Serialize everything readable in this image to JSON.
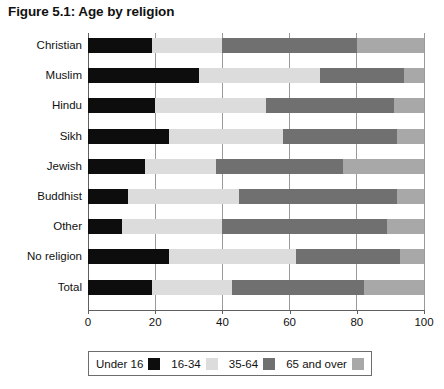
{
  "title": "Figure 5.1: Age by religion",
  "legend": {
    "entries": [
      {
        "label": "Under 16",
        "color": "#0d0d0d"
      },
      {
        "label": "16-34",
        "color": "#dcdcdc"
      },
      {
        "label": "35-64",
        "color": "#707070"
      },
      {
        "label": "65 and over",
        "color": "#a8a8a8"
      }
    ]
  },
  "axis": {
    "ticks": [
      {
        "label": "0",
        "value": 0
      },
      {
        "label": "20",
        "value": 20
      },
      {
        "label": "40",
        "value": 40
      },
      {
        "label": "60",
        "value": 60
      },
      {
        "label": "80",
        "value": 80
      },
      {
        "label": "100",
        "value": 100
      }
    ]
  },
  "chart_data": {
    "type": "bar",
    "orientation": "horizontal",
    "stacked": true,
    "title": "Figure 5.1: Age by religion",
    "xlabel": "",
    "ylabel": "",
    "xlim": [
      0,
      100
    ],
    "grid": true,
    "legend_position": "bottom",
    "categories": [
      "Christian",
      "Muslim",
      "Hindu",
      "Sikh",
      "Jewish",
      "Buddhist",
      "Other",
      "No religion",
      "Total"
    ],
    "series": [
      {
        "name": "Under 16",
        "color": "#0d0d0d",
        "values": [
          19,
          33,
          20,
          24,
          17,
          12,
          10,
          24,
          19
        ]
      },
      {
        "name": "16-34",
        "color": "#dcdcdc",
        "values": [
          21,
          36,
          33,
          34,
          21,
          33,
          30,
          38,
          24
        ]
      },
      {
        "name": "35-64",
        "color": "#707070",
        "values": [
          40,
          25,
          38,
          34,
          38,
          47,
          49,
          31,
          39
        ]
      },
      {
        "name": "65 and over",
        "color": "#a8a8a8",
        "values": [
          20,
          6,
          9,
          8,
          24,
          8,
          11,
          7,
          18
        ]
      }
    ]
  }
}
